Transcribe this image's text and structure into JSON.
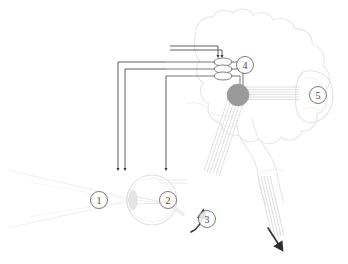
{
  "figure": {
    "type": "anatomical-diagram",
    "background_color": "#ffffff",
    "outline_color": "#e3e3e3",
    "arrow_color": "#3a3a3a",
    "node_fill_color": "#9a9a9a",
    "label_stroke_color": "#6b6b6b",
    "label_text_color": "#4a4a4a"
  },
  "labels": [
    {
      "id": "label-1",
      "number": "1",
      "x": 99,
      "y": 200,
      "refers_to": "cornea-lens"
    },
    {
      "id": "label-2",
      "number": "2",
      "x": 168,
      "y": 200,
      "refers_to": "retina-optic-disc"
    },
    {
      "id": "label-3",
      "number": "3",
      "x": 207,
      "y": 219,
      "refers_to": "optic-nerve-arrow"
    },
    {
      "id": "label-4",
      "number": "4",
      "x": 245,
      "y": 65,
      "refers_to": "relay-nuclei"
    },
    {
      "id": "label-5",
      "number": "5",
      "x": 318,
      "y": 95,
      "refers_to": "cerebellum"
    }
  ],
  "structures": {
    "brain": "brain-outline",
    "cerebellum": "cerebellum-outline",
    "eye": "eye-globe",
    "lens": "eye-lens",
    "light_rays": "light-ray-cone",
    "optic_tract": "optic-nerve-tract",
    "spinal_cord": "spinal-cord-tract",
    "nuclei": "stacked-nuclei-ovals",
    "relay_node": "gray-relay-node"
  },
  "arrows": {
    "descending": [
      {
        "id": "descending-arrow-left",
        "direction": "down"
      },
      {
        "id": "descending-arrow-mid",
        "direction": "down"
      },
      {
        "id": "descending-arrow-right",
        "direction": "down"
      }
    ],
    "into_nuclei": [
      {
        "id": "nuclei-arrow-a",
        "direction": "down"
      },
      {
        "id": "nuclei-arrow-b",
        "direction": "down"
      }
    ],
    "curved": {
      "id": "curved-arrow-3",
      "direction": "up-right"
    },
    "efferent": {
      "id": "spinal-output-arrow",
      "direction": "down-right"
    }
  }
}
